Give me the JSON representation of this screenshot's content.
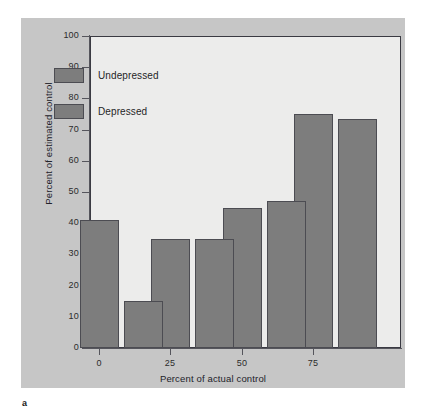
{
  "figure": {
    "panel_letter": "a",
    "background_color": "#c6c6c6",
    "plot_background_color": "#ececeb",
    "bar_color": "#7d7d7d",
    "bar_border_color": "#4c4c52",
    "axis_color": "#55555c"
  },
  "chart_data": {
    "type": "bar",
    "title": "",
    "xlabel": "Percent of actual control",
    "ylabel": "Percent of estimated control",
    "categories": [
      "0",
      "25",
      "50",
      "75"
    ],
    "series": [
      {
        "name": "Undepressed",
        "values": [
          41,
          35,
          45,
          75
        ],
        "color": "#7d7d7d"
      },
      {
        "name": "Depressed",
        "values": [
          15,
          35,
          47,
          73.5
        ],
        "color": "#7d7d7d"
      }
    ],
    "ylim": [
      0,
      100
    ],
    "yticks": [
      0,
      10,
      20,
      30,
      40,
      50,
      60,
      70,
      80,
      90,
      100
    ],
    "ytick_labels": [
      "0",
      "10",
      "20",
      "30",
      "40",
      "50",
      "60",
      "70",
      "80",
      "90",
      "100"
    ],
    "xtick_labels": [
      "0",
      "25",
      "50",
      "75"
    ],
    "grid": false,
    "legend_position": "upper left",
    "legend_entries": [
      "Undepressed",
      "Depressed"
    ]
  }
}
